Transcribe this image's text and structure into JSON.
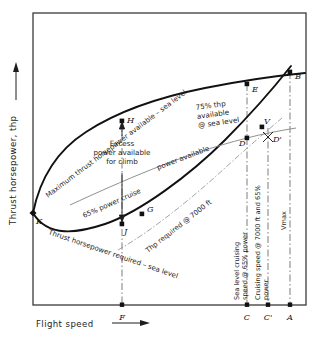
{
  "figure": {
    "type": "engineering-diagram",
    "axes": {
      "y_label": "Thrust horsepower, thp",
      "x_label": "Flight speed",
      "x_arrow": "⟶",
      "y_arrow": "↑",
      "grid": "none",
      "ticks": "none"
    },
    "curve_labels": {
      "power_available": "Maximum thrust horsepower available – sea level",
      "power_required": "Thrust horsepower required – sea level",
      "cruise_line": "65% power cruise",
      "power_available_line": "power available",
      "thp_75": "75% thp\navailable\n@ sea level",
      "thp_75_l1": "75% thp",
      "thp_75_l2": "available",
      "thp_75_l3": "@ sea level",
      "thp_7000": "Thp required @ 7000 ft"
    },
    "annotations": {
      "excess_l1": "Excess",
      "excess_l2": "power available",
      "excess_l3": "for climb"
    },
    "vertical_callouts": [
      {
        "id": "C",
        "line1": "Sea level cruising",
        "line2": "speed @ 65% power"
      },
      {
        "id": "Cp",
        "line1": "Cruising speed @ 7000 ft and 65%",
        "line2": "power"
      },
      {
        "id": "A",
        "line1": "Vₘₐₓ",
        "line2": ""
      }
    ],
    "vmax_label": "Vmax",
    "points": [
      {
        "id": "K",
        "label": "K",
        "x": 33,
        "y": 213
      },
      {
        "id": "H",
        "label": "H",
        "x": 122,
        "y": 121
      },
      {
        "id": "J",
        "label": "J",
        "x": 122,
        "y": 224
      },
      {
        "id": "G",
        "label": "G",
        "x": 142,
        "y": 214
      },
      {
        "id": "E",
        "label": "E",
        "x": 247,
        "y": 84
      },
      {
        "id": "B",
        "label": "B",
        "x": 290,
        "y": 72
      },
      {
        "id": "D",
        "label": "D",
        "x": 247,
        "y": 138
      },
      {
        "id": "Dp",
        "label": "D'",
        "x": 268,
        "y": 136
      },
      {
        "id": "V",
        "label": "V",
        "x": 262,
        "y": 127
      }
    ],
    "axis_ticks": [
      {
        "label": "F",
        "x": 122
      },
      {
        "label": "C",
        "x": 247
      },
      {
        "label": "C'",
        "x": 268
      },
      {
        "label": "A",
        "x": 290
      }
    ],
    "colors": {
      "ink": "#1a1a1a",
      "frame": "#3a3a3a",
      "thin_line": "#7a7a7a",
      "background": "#ffffff"
    }
  }
}
